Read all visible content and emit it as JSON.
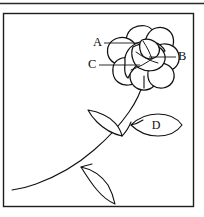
{
  "figure": {
    "type": "line-drawing",
    "style": "black-and-white-ink-outline",
    "background_color": "#ffffff",
    "ink_color": "#111111",
    "frame": {
      "visible": true,
      "border_color": "#1d1d1d",
      "x": 3,
      "y": 13,
      "width": 191,
      "height": 194
    },
    "top_rule": {
      "visible": true,
      "color": "#2a2a2a",
      "y": 3
    }
  },
  "labels": [
    {
      "id": "A",
      "text": "A",
      "x": 93,
      "y": 43,
      "leader": {
        "x1": 104,
        "y1": 43,
        "x2": 139,
        "y2": 43
      },
      "target": "upper-left-petal"
    },
    {
      "id": "B",
      "text": "B",
      "x": 178,
      "y": 57,
      "leader": {
        "x1": 176,
        "y1": 57,
        "x2": 149,
        "y2": 57
      },
      "target": "right-petal"
    },
    {
      "id": "C",
      "text": "C",
      "x": 88,
      "y": 65,
      "leader": {
        "x1": 99,
        "y1": 65,
        "x2": 140,
        "y2": 65
      },
      "target": "inner-center-petal"
    },
    {
      "id": "D",
      "text": "D",
      "x": 153,
      "y": 126,
      "leader": null,
      "target": "right-leaf"
    }
  ],
  "parts": {
    "flower_center": {
      "cx": 144,
      "cy": 55
    },
    "petal_count": 8,
    "stem": {
      "description": "curving stem from lower-left frame edge to flower base"
    },
    "leaves": [
      {
        "name": "upper-left-leaf",
        "labelled": false
      },
      {
        "name": "lower-left-leaf",
        "labelled": false
      },
      {
        "name": "right-leaf",
        "labelled": true,
        "label": "D"
      }
    ]
  }
}
